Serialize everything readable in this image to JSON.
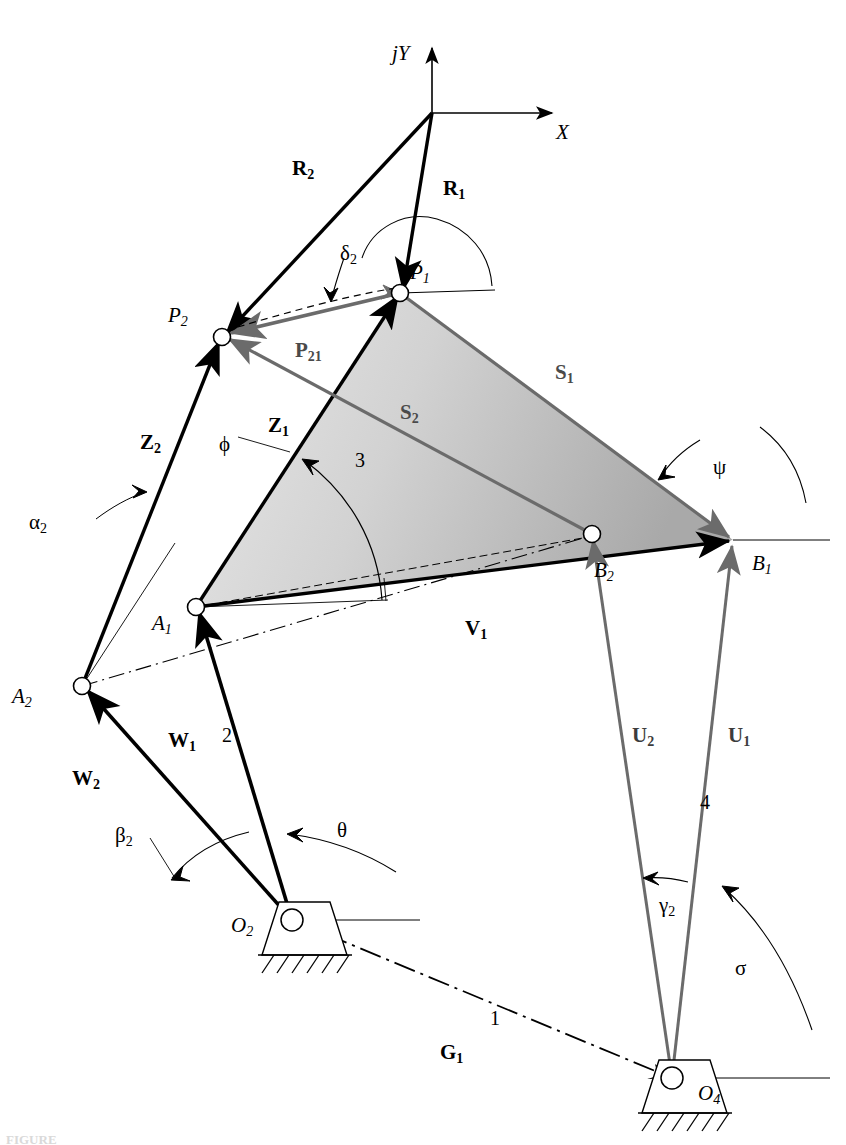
{
  "figure": {
    "type": "kinematic-diagram",
    "background_color": "#ffffff",
    "stroke_color": "#000000",
    "gray_stroke_color": "#6b6b6b",
    "coupler_fill_light": "#e2e2e2",
    "coupler_fill_dark": "#adadad"
  },
  "axes": {
    "origin": {
      "x": 432,
      "y": 113
    },
    "y_label": "jY",
    "x_label": "X"
  },
  "points": [
    {
      "name": "P1",
      "base": "P",
      "sub": "1",
      "x": 400,
      "y": 293,
      "label_x": 410,
      "label_y": 262
    },
    {
      "name": "P2",
      "base": "P",
      "sub": "2",
      "x": 222,
      "y": 337,
      "label_x": 168,
      "label_y": 305
    },
    {
      "name": "A1",
      "base": "A",
      "sub": "1",
      "x": 196,
      "y": 607,
      "label_x": 152,
      "label_y": 613
    },
    {
      "name": "A2",
      "base": "A",
      "sub": "2",
      "x": 82,
      "y": 686,
      "label_x": 12,
      "label_y": 686
    },
    {
      "name": "B1",
      "base": "B",
      "sub": "1",
      "x": 733,
      "y": 540,
      "label_x": 752,
      "label_y": 553
    },
    {
      "name": "B2",
      "base": "B",
      "sub": "2",
      "x": 592,
      "y": 534,
      "label_x": 594,
      "label_y": 560
    },
    {
      "name": "O2",
      "base": "O",
      "sub": "2",
      "x": 292,
      "y": 920,
      "label_x": 231,
      "label_y": 915
    },
    {
      "name": "O4",
      "base": "O",
      "sub": "4",
      "x": 672,
      "y": 1078,
      "label_x": 698,
      "label_y": 1083
    }
  ],
  "vectors": [
    {
      "name": "R1",
      "base": "R",
      "sub": "1",
      "label_x": 443,
      "label_y": 178,
      "color": "black",
      "style": "solid"
    },
    {
      "name": "R2",
      "base": "R",
      "sub": "2",
      "label_x": 292,
      "label_y": 158,
      "color": "black",
      "style": "solid"
    },
    {
      "name": "P21",
      "base": "P",
      "sub": "21",
      "label_x": 295,
      "label_y": 340,
      "color": "gray",
      "style": "solid"
    },
    {
      "name": "Z1",
      "base": "Z",
      "sub": "1",
      "label_x": 268,
      "label_y": 415,
      "color": "black",
      "style": "solid"
    },
    {
      "name": "Z2",
      "base": "Z",
      "sub": "2",
      "label_x": 140,
      "label_y": 432,
      "color": "black",
      "style": "solid"
    },
    {
      "name": "S1",
      "base": "S",
      "sub": "1",
      "label_x": 555,
      "label_y": 362,
      "color": "gray",
      "style": "solid"
    },
    {
      "name": "S2",
      "base": "S",
      "sub": "2",
      "label_x": 400,
      "label_y": 402,
      "color": "gray",
      "style": "solid"
    },
    {
      "name": "V1",
      "base": "V",
      "sub": "1",
      "label_x": 465,
      "label_y": 618,
      "color": "black",
      "style": "solid"
    },
    {
      "name": "W1",
      "base": "W",
      "sub": "1",
      "label_x": 168,
      "label_y": 730,
      "color": "black",
      "style": "solid"
    },
    {
      "name": "W2",
      "base": "W",
      "sub": "2",
      "label_x": 72,
      "label_y": 768,
      "color": "black",
      "style": "solid"
    },
    {
      "name": "U1",
      "base": "U",
      "sub": "1",
      "label_x": 728,
      "label_y": 725,
      "color": "gray",
      "style": "solid"
    },
    {
      "name": "U2",
      "base": "U",
      "sub": "2",
      "label_x": 632,
      "label_y": 725,
      "color": "gray",
      "style": "solid"
    },
    {
      "name": "G1",
      "base": "G",
      "sub": "1",
      "label_x": 440,
      "label_y": 1042,
      "color": "black",
      "style": "dash-dot"
    }
  ],
  "angles": [
    {
      "name": "delta2",
      "glyph": "δ",
      "sub": "2",
      "label_x": 340,
      "label_y": 243
    },
    {
      "name": "phi",
      "glyph": "ϕ",
      "sub": "",
      "label_x": 219,
      "label_y": 434
    },
    {
      "name": "psi",
      "glyph": "ψ",
      "sub": "",
      "label_x": 713,
      "label_y": 457
    },
    {
      "name": "alpha2",
      "glyph": "α",
      "sub": "2",
      "label_x": 29,
      "label_y": 512
    },
    {
      "name": "beta2",
      "glyph": "β",
      "sub": "2",
      "label_x": 115,
      "label_y": 825
    },
    {
      "name": "theta",
      "glyph": "θ",
      "sub": "",
      "label_x": 337,
      "label_y": 820
    },
    {
      "name": "gamma2",
      "glyph": "γ",
      "sub": "2",
      "label_x": 659,
      "label_y": 895
    },
    {
      "name": "sigma",
      "glyph": "σ",
      "sub": "",
      "label_x": 735,
      "label_y": 958
    }
  ],
  "link_numbers": [
    {
      "label": "1",
      "x": 490,
      "y": 1008
    },
    {
      "label": "2",
      "x": 222,
      "y": 725
    },
    {
      "label": "3",
      "x": 355,
      "y": 450
    },
    {
      "label": "4",
      "x": 700,
      "y": 792
    }
  ],
  "ground_pivots": [
    {
      "name": "O2",
      "x": 292,
      "y": 920
    },
    {
      "name": "O4",
      "x": 672,
      "y": 1078
    }
  ],
  "caption": "FIGURE"
}
